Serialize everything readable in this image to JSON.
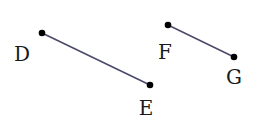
{
  "diagram": {
    "segments": [
      {
        "name": "DE",
        "from": "D",
        "to": "E"
      },
      {
        "name": "FG",
        "from": "F",
        "to": "G"
      }
    ],
    "points": {
      "D": {
        "label": "D",
        "x": 42,
        "y": 33,
        "lx": 22,
        "ly": 61
      },
      "E": {
        "label": "E",
        "x": 150,
        "y": 85,
        "lx": 146,
        "ly": 115
      },
      "F": {
        "label": "F",
        "x": 168,
        "y": 25,
        "lx": 165,
        "ly": 59
      },
      "G": {
        "label": "G",
        "x": 234,
        "y": 57,
        "lx": 234,
        "ly": 84
      }
    },
    "colors": {
      "line": "#4a4a6a",
      "point": "#000000",
      "text": "#1a1a1a"
    }
  }
}
